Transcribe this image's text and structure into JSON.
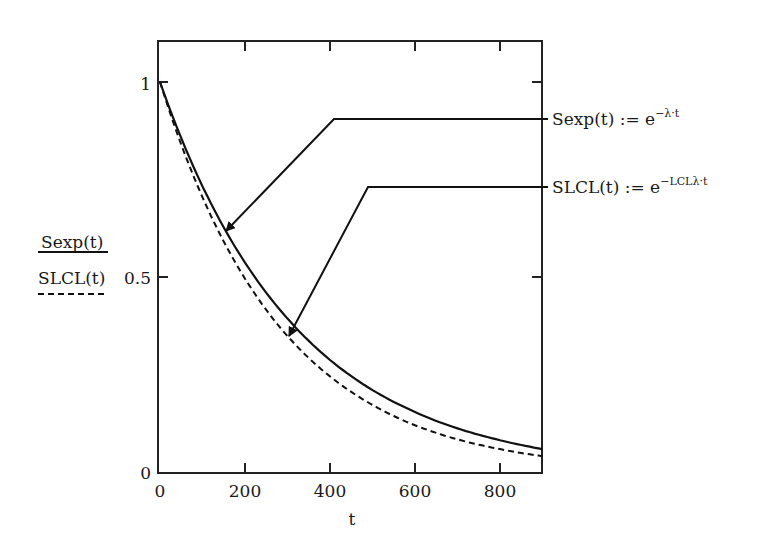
{
  "chart_data": {
    "type": "line",
    "title": "",
    "xlabel": "t",
    "ylabel_series": [
      "Sexp(t)",
      "SLCL(t)"
    ],
    "xlim": [
      0,
      900
    ],
    "ylim": [
      0,
      1.1
    ],
    "x_ticks": [
      "0",
      "200",
      "400",
      "600",
      "800"
    ],
    "y_ticks": [
      "0",
      "0.5",
      "1"
    ],
    "grid": false,
    "series": [
      {
        "name": "Sexp(t)",
        "style": "solid",
        "formula": "e^(-λ·t)",
        "x": [
          0,
          100,
          200,
          300,
          400,
          500,
          600,
          700,
          800,
          900
        ],
        "values": [
          1.0,
          0.733,
          0.538,
          0.395,
          0.289,
          0.212,
          0.156,
          0.114,
          0.084,
          0.061
        ]
      },
      {
        "name": "SLCL(t)",
        "style": "dashed",
        "formula": "e^(-LCLλ·t)",
        "x": [
          0,
          100,
          200,
          300,
          400,
          500,
          600,
          700,
          800,
          900
        ],
        "values": [
          1.0,
          0.705,
          0.497,
          0.35,
          0.247,
          0.174,
          0.122,
          0.086,
          0.061,
          0.043
        ]
      }
    ],
    "annotations": [
      {
        "text": "Sexp(t) := e^(−λ·t)",
        "points_to": "Sexp(t)"
      },
      {
        "text": "SLCL(t) := e^(−LCLλ·t)",
        "points_to": "SLCL(t)"
      }
    ]
  },
  "labels": {
    "legend1": "Sexp(t)",
    "legend2": "SLCL(t)",
    "xlabel": "t",
    "ann1_base": "Sexp(t) := e",
    "ann1_exp": "−λ·t",
    "ann2_base": "SLCL(t) := e",
    "ann2_exp": "−LCLλ·t",
    "xt0": "0",
    "xt1": "200",
    "xt2": "400",
    "xt3": "600",
    "xt4": "800",
    "yt0": "0",
    "yt1": "0.5",
    "yt2": "1"
  }
}
